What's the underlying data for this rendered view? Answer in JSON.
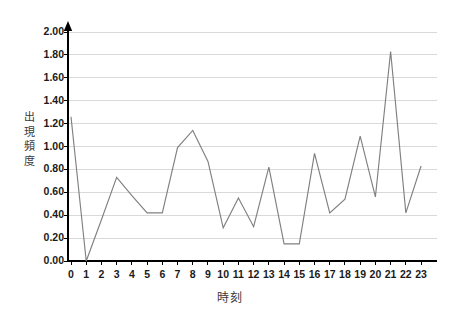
{
  "chart_data": {
    "type": "line",
    "title": "",
    "xlabel": "時刻",
    "ylabel": "出現頻度",
    "categories": [
      "0",
      "1",
      "2",
      "3",
      "4",
      "5",
      "6",
      "7",
      "8",
      "9",
      "10",
      "11",
      "12",
      "13",
      "14",
      "15",
      "16",
      "17",
      "18",
      "19",
      "20",
      "21",
      "22",
      "23"
    ],
    "x": [
      0,
      1,
      2,
      3,
      4,
      5,
      6,
      7,
      8,
      9,
      10,
      11,
      12,
      13,
      14,
      15,
      16,
      17,
      18,
      19,
      20,
      21,
      22,
      23
    ],
    "values": [
      1.26,
      0.0,
      0.36,
      0.73,
      0.57,
      0.42,
      0.42,
      0.99,
      1.14,
      0.87,
      0.29,
      0.55,
      0.3,
      0.82,
      0.15,
      0.15,
      0.94,
      0.42,
      0.54,
      1.09,
      0.56,
      1.83,
      0.42,
      0.83
    ],
    "ylim": [
      0.0,
      2.0
    ],
    "xlim": [
      0,
      23
    ],
    "ytick_labels": [
      "2.00",
      "1.80",
      "1.60",
      "1.40",
      "1.20",
      "1.00",
      "0.80",
      "0.60",
      "0.40",
      "0.20",
      "0.00"
    ],
    "ytick_values": [
      2.0,
      1.8,
      1.6,
      1.4,
      1.2,
      1.0,
      0.8,
      0.6,
      0.4,
      0.2,
      0.0
    ],
    "grid": true,
    "grid_axis": "y",
    "legend": false,
    "legend_position": "none",
    "series_color": "#808080",
    "axis_color": "#000000",
    "grid_color": "#d9d9d9",
    "label_color": "#3b3b3b",
    "background": "#ffffff"
  }
}
